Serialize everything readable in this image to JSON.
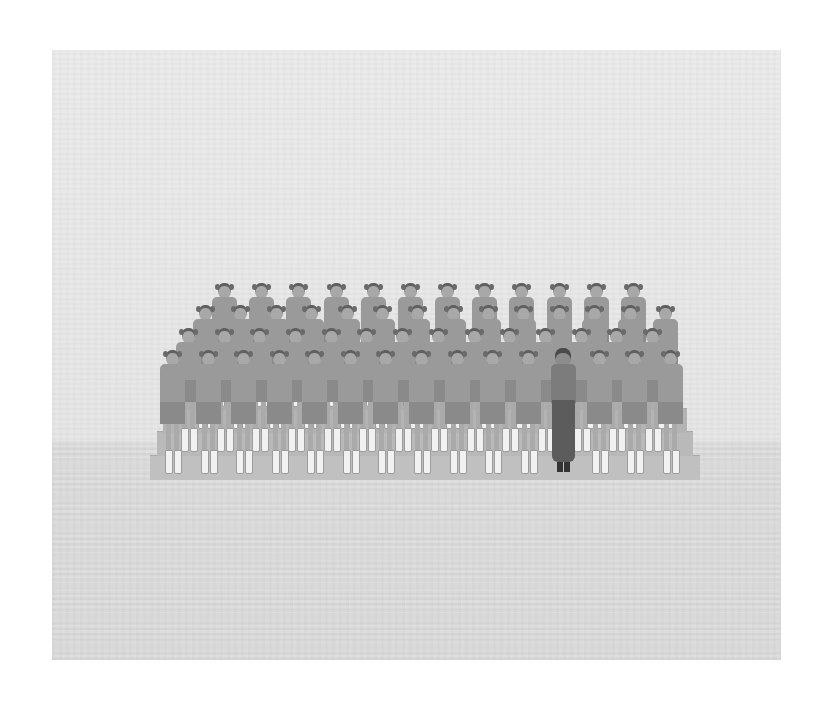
{
  "image": {
    "description": "Vintage black-and-white group photograph: rows of identically dressed girls in caps, sweaters, skirts and white boots standing on tiered bleachers, with a single woman in a dark draped dress standing in the front row",
    "colors": {
      "background_page": "#ffffff",
      "backdrop": "#e8e8e8",
      "floor": "#dcdcdc",
      "bleacher": "#b9b9b9",
      "uniform": "#9a9a9a",
      "boots": "#f1f1f1",
      "woman_dress": "#5c5c5c"
    },
    "photo_bounds": {
      "x": 52,
      "y": 50,
      "width": 729,
      "height": 610
    },
    "horizon_y": 445,
    "rows": [
      {
        "name": "back-row",
        "count": 12,
        "y": 283,
        "x_start": 224,
        "x_end": 633
      },
      {
        "name": "row-3",
        "count": 14,
        "y": 305,
        "x_start": 205,
        "x_end": 665
      },
      {
        "name": "row-2",
        "count": 14,
        "y": 328,
        "x_start": 188,
        "x_end": 652
      },
      {
        "name": "front-row",
        "count": 15,
        "y": 350,
        "x_start": 172,
        "x_end": 670
      }
    ],
    "woman_position": {
      "row": "front-row",
      "index": 11
    },
    "bleacher_steps": 4
  }
}
